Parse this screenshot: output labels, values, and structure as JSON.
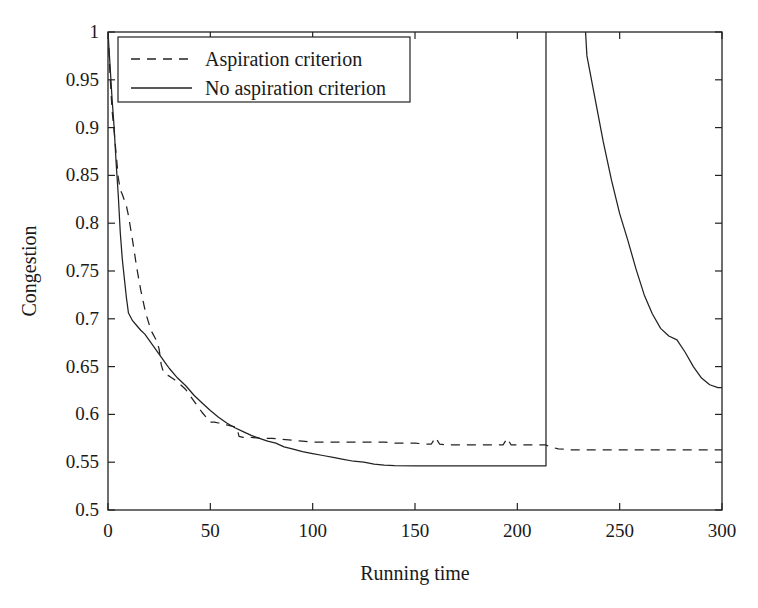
{
  "chart_data": {
    "type": "line",
    "title": "",
    "xlabel": "Running time",
    "ylabel": "Congestion",
    "xlim": [
      0,
      300
    ],
    "ylim": [
      0.5,
      1
    ],
    "xticks": [
      0,
      50,
      100,
      150,
      200,
      250,
      300
    ],
    "xtick_labels": [
      "0",
      "50",
      "100",
      "150",
      "200",
      "250",
      "300"
    ],
    "yticks": [
      0.5,
      0.55,
      0.6,
      0.65,
      0.7,
      0.75,
      0.8,
      0.85,
      0.9,
      0.95,
      1
    ],
    "ytick_labels": [
      "0.5",
      "0.55",
      "0.6",
      "0.65",
      "0.7",
      "0.75",
      "0.8",
      "0.85",
      "0.9",
      "0.95",
      "1"
    ],
    "grid": false,
    "legend_position": "top-left",
    "legend_entries": [
      "Aspiration criterion",
      "No aspiration criterion"
    ],
    "series": [
      {
        "name": "Aspiration criterion",
        "style": "dashed",
        "color": "#222222",
        "note": "Drops steeply from 1.0, crosses above the solid curve between x=10 and x=85, settles to a plateau near 0.546, then jumps vertically off the top of the axis at x=214 and re-enters descending from above 1.0 at x=232 down to about 0.63 at x=300.",
        "points": [
          [
            0,
            1.0
          ],
          [
            1,
            0.965
          ],
          [
            2,
            0.93
          ],
          [
            3,
            0.9
          ],
          [
            4,
            0.862
          ],
          [
            5,
            0.83
          ],
          [
            6,
            0.79
          ],
          [
            7,
            0.762
          ],
          [
            8,
            0.742
          ],
          [
            9,
            0.722
          ],
          [
            10,
            0.706
          ],
          [
            12,
            0.698
          ],
          [
            14,
            0.693
          ],
          [
            16,
            0.688
          ],
          [
            18,
            0.684
          ],
          [
            20,
            0.678
          ],
          [
            22,
            0.672
          ],
          [
            24,
            0.666
          ],
          [
            26,
            0.66
          ],
          [
            28,
            0.654
          ],
          [
            30,
            0.648
          ],
          [
            34,
            0.638
          ],
          [
            38,
            0.63
          ],
          [
            42,
            0.62
          ],
          [
            46,
            0.612
          ],
          [
            50,
            0.604
          ],
          [
            54,
            0.597
          ],
          [
            58,
            0.591
          ],
          [
            62,
            0.586
          ],
          [
            66,
            0.582
          ],
          [
            70,
            0.578
          ],
          [
            74,
            0.575
          ],
          [
            78,
            0.572
          ],
          [
            82,
            0.57
          ],
          [
            86,
            0.566
          ],
          [
            90,
            0.564
          ],
          [
            95,
            0.561
          ],
          [
            100,
            0.559
          ],
          [
            105,
            0.557
          ],
          [
            110,
            0.555
          ],
          [
            115,
            0.553
          ],
          [
            120,
            0.551
          ],
          [
            125,
            0.55
          ],
          [
            130,
            0.548
          ],
          [
            135,
            0.547
          ],
          [
            140,
            0.5465
          ],
          [
            150,
            0.5462
          ],
          [
            160,
            0.5462
          ],
          [
            170,
            0.5462
          ],
          [
            180,
            0.5462
          ],
          [
            190,
            0.5462
          ],
          [
            200,
            0.5462
          ],
          [
            210,
            0.5462
          ],
          [
            214,
            0.5462
          ],
          [
            214,
            1.05
          ],
          [
            232,
            1.05
          ],
          [
            234,
            0.975
          ],
          [
            238,
            0.93
          ],
          [
            242,
            0.885
          ],
          [
            246,
            0.845
          ],
          [
            250,
            0.81
          ],
          [
            254,
            0.782
          ],
          [
            258,
            0.752
          ],
          [
            262,
            0.725
          ],
          [
            266,
            0.705
          ],
          [
            270,
            0.69
          ],
          [
            274,
            0.682
          ],
          [
            278,
            0.678
          ],
          [
            282,
            0.665
          ],
          [
            286,
            0.65
          ],
          [
            290,
            0.638
          ],
          [
            294,
            0.631
          ],
          [
            298,
            0.628
          ],
          [
            300,
            0.628
          ]
        ]
      },
      {
        "name": "No aspiration criterion",
        "style": "solid",
        "color": "#222222",
        "note": "Drops steeply from 1.0, descends in a series of steps to a plateau near 0.567 by x=65, remains essentially flat with small spikes near x=160 and x=195, and finishes at about 0.563 at x=300.",
        "points": [
          [
            0,
            1.0
          ],
          [
            1,
            0.955
          ],
          [
            2,
            0.918
          ],
          [
            3,
            0.896
          ],
          [
            4,
            0.872
          ],
          [
            5,
            0.848
          ],
          [
            6,
            0.835
          ],
          [
            7,
            0.83
          ],
          [
            8,
            0.824
          ],
          [
            9,
            0.818
          ],
          [
            10,
            0.808
          ],
          [
            11,
            0.795
          ],
          [
            12,
            0.782
          ],
          [
            13,
            0.768
          ],
          [
            14,
            0.754
          ],
          [
            15,
            0.742
          ],
          [
            16,
            0.73
          ],
          [
            17,
            0.72
          ],
          [
            18,
            0.71
          ],
          [
            19,
            0.702
          ],
          [
            20,
            0.695
          ],
          [
            21,
            0.688
          ],
          [
            22,
            0.684
          ],
          [
            23,
            0.68
          ],
          [
            24,
            0.676
          ],
          [
            25,
            0.668
          ],
          [
            26,
            0.652
          ],
          [
            27,
            0.645
          ],
          [
            28,
            0.642
          ],
          [
            30,
            0.64
          ],
          [
            32,
            0.637
          ],
          [
            34,
            0.634
          ],
          [
            36,
            0.63
          ],
          [
            38,
            0.626
          ],
          [
            40,
            0.62
          ],
          [
            42,
            0.614
          ],
          [
            44,
            0.608
          ],
          [
            46,
            0.602
          ],
          [
            48,
            0.597
          ],
          [
            49,
            0.594
          ],
          [
            50,
            0.592
          ],
          [
            52,
            0.592
          ],
          [
            54,
            0.591
          ],
          [
            56,
            0.59
          ],
          [
            58,
            0.589
          ],
          [
            60,
            0.588
          ],
          [
            62,
            0.587
          ],
          [
            63,
            0.586
          ],
          [
            64,
            0.577
          ],
          [
            66,
            0.576
          ],
          [
            70,
            0.576
          ],
          [
            75,
            0.575
          ],
          [
            80,
            0.575
          ],
          [
            85,
            0.574
          ],
          [
            90,
            0.573
          ],
          [
            95,
            0.572
          ],
          [
            100,
            0.571
          ],
          [
            105,
            0.571
          ],
          [
            110,
            0.571
          ],
          [
            115,
            0.571
          ],
          [
            120,
            0.571
          ],
          [
            125,
            0.571
          ],
          [
            130,
            0.571
          ],
          [
            135,
            0.571
          ],
          [
            140,
            0.57
          ],
          [
            145,
            0.57
          ],
          [
            150,
            0.57
          ],
          [
            155,
            0.569
          ],
          [
            158,
            0.569
          ],
          [
            160,
            0.576
          ],
          [
            162,
            0.569
          ],
          [
            166,
            0.568
          ],
          [
            170,
            0.568
          ],
          [
            175,
            0.568
          ],
          [
            180,
            0.568
          ],
          [
            185,
            0.568
          ],
          [
            190,
            0.568
          ],
          [
            193,
            0.568
          ],
          [
            195,
            0.575
          ],
          [
            197,
            0.568
          ],
          [
            200,
            0.568
          ],
          [
            205,
            0.568
          ],
          [
            210,
            0.568
          ],
          [
            214,
            0.568
          ],
          [
            216,
            0.566
          ],
          [
            220,
            0.564
          ],
          [
            226,
            0.563
          ],
          [
            232,
            0.563
          ],
          [
            240,
            0.563
          ],
          [
            250,
            0.563
          ],
          [
            260,
            0.563
          ],
          [
            270,
            0.563
          ],
          [
            280,
            0.563
          ],
          [
            290,
            0.563
          ],
          [
            300,
            0.563
          ]
        ]
      }
    ]
  }
}
